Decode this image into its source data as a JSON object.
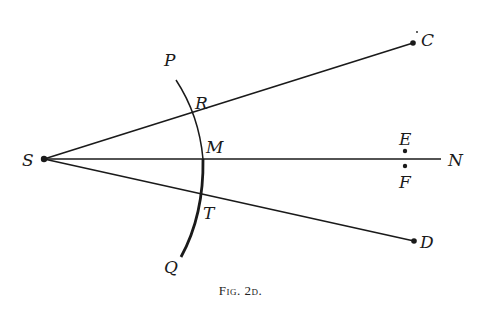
{
  "figure": {
    "caption": "Fig. 2d.",
    "labels": {
      "S": "S",
      "P": "P",
      "R": "R",
      "M": "M",
      "T": "T",
      "Q": "Q",
      "C": "C",
      "D": "D",
      "E": "E",
      "F": "F",
      "N": "N"
    },
    "points": {
      "S": [
        44,
        159
      ],
      "C": [
        413,
        43
      ],
      "D": [
        414,
        241
      ],
      "N_end": [
        441,
        159
      ],
      "E": [
        405,
        151
      ],
      "F": [
        405,
        166
      ],
      "P_arc_top": [
        176,
        80
      ],
      "R": [
        195,
        123
      ],
      "M": [
        203,
        159
      ],
      "T": [
        201,
        197
      ],
      "Q_arc_bottom": [
        181,
        257
      ]
    },
    "colors": {
      "ink": "#1a1a1a",
      "background": "#ffffff"
    }
  }
}
